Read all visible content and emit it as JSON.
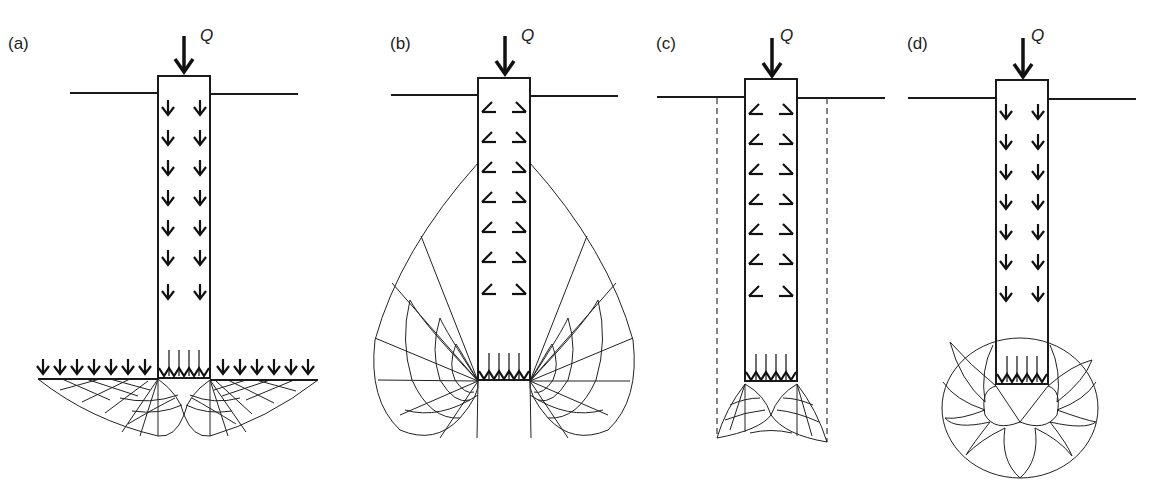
{
  "figure": {
    "line_color": "#1a1a1a",
    "background": "#ffffff",
    "load_label": "Q",
    "panels": [
      {
        "id": "a",
        "label": "(a)",
        "load": "Q",
        "shaft_friction": "downward arrows",
        "base_mechanism": "shallow log-spiral failure zones with surcharge arrows at pile base level"
      },
      {
        "id": "b",
        "label": "(b)",
        "load": "Q",
        "shaft_friction": "inclined outward arrows",
        "base_mechanism": "deep heart-shaped failure zone extending up the shaft"
      },
      {
        "id": "c",
        "label": "(c)",
        "load": "Q",
        "shaft_friction": "inclined outward arrows",
        "base_mechanism": "local failure zone confined between dashed vertical lines"
      },
      {
        "id": "d",
        "label": "(d)",
        "load": "Q",
        "shaft_friction": "downward arrows",
        "base_mechanism": "spherical cavity expansion bulb"
      }
    ]
  }
}
